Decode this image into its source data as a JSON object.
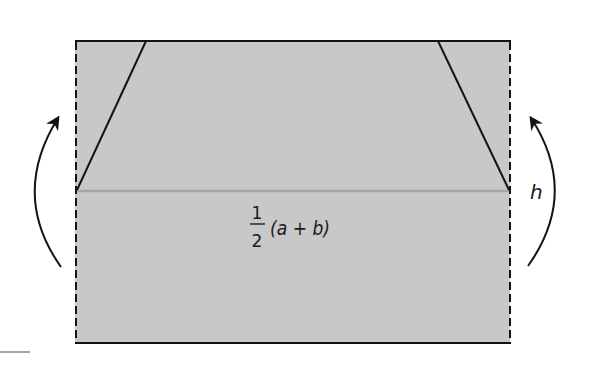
{
  "diagram": {
    "colors": {
      "fill": "#c8c8c8",
      "stroke": "#141414",
      "midline": "#a6a6a6",
      "background": "#ffffff"
    },
    "rectangle": {
      "x": 75,
      "y": 41,
      "width": 435,
      "height": 302
    },
    "trapezoid_top_points": {
      "left_slant_top_x": 146,
      "right_slant_top_x": 438,
      "midline_y": 191
    },
    "labels": {
      "width_numerator": "1",
      "width_denominator": "2",
      "width_expression": "(a + b)",
      "height": "h"
    },
    "arrows": [
      {
        "side": "left",
        "direction": "up"
      },
      {
        "side": "right",
        "direction": "up"
      }
    ]
  }
}
